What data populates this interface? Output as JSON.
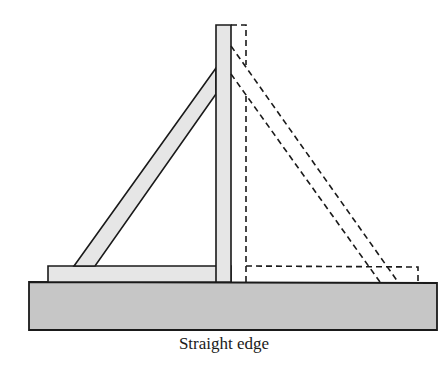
{
  "figure": {
    "caption": "Straight edge",
    "colors": {
      "base_fill": "#c6c6c6",
      "board_fill": "#e6e6e6",
      "stroke": "#1a1a1a",
      "background": "#ffffff"
    },
    "parts": [
      {
        "name": "straight-edge-base",
        "style": "solid"
      },
      {
        "name": "vertical-post",
        "style": "solid"
      },
      {
        "name": "horizontal-foot",
        "style": "solid"
      },
      {
        "name": "diagonal-brace",
        "style": "solid"
      },
      {
        "name": "flipped-post",
        "style": "dashed"
      },
      {
        "name": "flipped-foot",
        "style": "dashed"
      },
      {
        "name": "flipped-brace",
        "style": "dashed"
      }
    ]
  }
}
